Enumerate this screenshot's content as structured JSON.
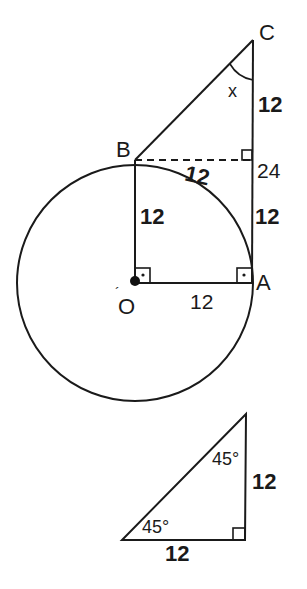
{
  "figure": {
    "points": {
      "A": "A",
      "B": "B",
      "C": "C",
      "O": "O"
    },
    "angle_label": "x",
    "labels": {
      "CD": "12",
      "BD_dashed": "12",
      "OB": "12",
      "DA": "12",
      "OA": "12",
      "total_CA": "24"
    }
  },
  "triangle": {
    "angle_top": "45°",
    "angle_left": "45°",
    "side_right": "12",
    "side_bottom": "12"
  },
  "colors": {
    "stroke": "#1a1a1a",
    "background": "#ffffff"
  }
}
